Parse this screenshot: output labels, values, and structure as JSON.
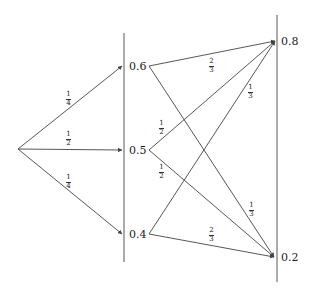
{
  "diagram": {
    "type": "probability-tree",
    "line_color": "#444444",
    "root": {
      "x": 18,
      "y": 149
    },
    "columns": [
      {
        "x": 124,
        "y_top": 33,
        "y_bottom": 262
      },
      {
        "x": 277,
        "y_top": 15,
        "y_bottom": 282
      }
    ],
    "stage1_nodes": [
      {
        "id": "n06",
        "label": "0.6",
        "x": 124,
        "y": 66,
        "label_x": 129,
        "label_y": 61,
        "out_x": 149
      },
      {
        "id": "n05",
        "label": "0.5",
        "x": 124,
        "y": 150,
        "label_x": 129,
        "label_y": 145,
        "out_x": 149
      },
      {
        "id": "n04",
        "label": "0.4",
        "x": 124,
        "y": 234,
        "label_x": 129,
        "label_y": 229,
        "out_x": 149
      }
    ],
    "stage2_nodes": [
      {
        "id": "n08",
        "label": "0.8",
        "x": 275,
        "y": 41,
        "label_x": 281,
        "label_y": 36
      },
      {
        "id": "n02",
        "label": "0.2",
        "x": 274,
        "y": 257,
        "label_x": 281,
        "label_y": 252
      }
    ],
    "stage1_edges": [
      {
        "to": "n06",
        "num": "1",
        "den": "4",
        "lx": 66,
        "ly": 91
      },
      {
        "to": "n05",
        "num": "1",
        "den": "2",
        "lx": 66,
        "ly": 131
      },
      {
        "to": "n04",
        "num": "1",
        "den": "4",
        "lx": 66,
        "ly": 174
      }
    ],
    "stage2_edges": [
      {
        "from": "n06",
        "to": "n08",
        "num": "2",
        "den": "3",
        "lx": 209,
        "ly": 58
      },
      {
        "from": "n06",
        "to": "n02",
        "num": "1",
        "den": "3",
        "lx": 249,
        "ly": 202
      },
      {
        "from": "n05",
        "to": "n08",
        "num": "1",
        "den": "2",
        "lx": 159,
        "ly": 120
      },
      {
        "from": "n05",
        "to": "n02",
        "num": "1",
        "den": "2",
        "lx": 159,
        "ly": 164
      },
      {
        "from": "n04",
        "to": "n08",
        "num": "1",
        "den": "3",
        "lx": 248,
        "ly": 84
      },
      {
        "from": "n04",
        "to": "n02",
        "num": "2",
        "den": "3",
        "lx": 209,
        "ly": 227
      }
    ]
  }
}
